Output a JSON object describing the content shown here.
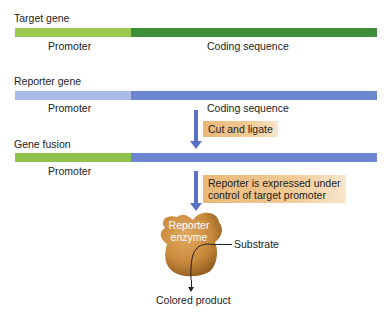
{
  "colors": {
    "target_promoter": "#9cc94f",
    "target_coding": "#3f8f3a",
    "reporter_promoter": "#a9bbe6",
    "reporter_coding": "#6d86d0",
    "fusion_promoter": "#8fc24a",
    "fusion_coding": "#6d86d0",
    "arrow": "#5a70c2",
    "callout": "#eebd80",
    "enzyme": "#c98a3c"
  },
  "target_gene": {
    "title": "Target gene",
    "promoter_label": "Promoter",
    "coding_label": "Coding sequence"
  },
  "reporter_gene": {
    "title": "Reporter gene",
    "promoter_label": "Promoter",
    "coding_label": "Coding sequence"
  },
  "step1": {
    "label": "Cut and ligate"
  },
  "gene_fusion": {
    "title": "Gene fusion",
    "promoter_label": "Promoter"
  },
  "step2": {
    "line1": "Reporter is expressed under",
    "line2": "control of target promoter"
  },
  "enzyme": {
    "line1": "Reporter",
    "line2": "enzyme",
    "substrate_label": "Substrate",
    "product_label": "Colored product"
  }
}
